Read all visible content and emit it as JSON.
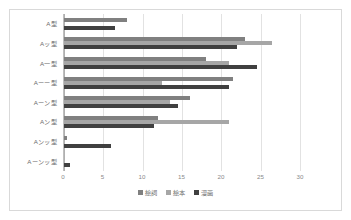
{
  "chart_data": {
    "type": "bar",
    "orientation": "horizontal",
    "title": "",
    "xlabel": "",
    "ylabel": "",
    "xlim": [
      0,
      30
    ],
    "xticks": [
      0,
      5,
      10,
      15,
      20,
      25,
      30
    ],
    "grid": true,
    "legend_position": "bottom",
    "categories": [
      "A型",
      "Aッ型",
      "A一型",
      "Aーー型",
      "Aーン型",
      "Aン型",
      "Aンッ型",
      "Aーンッ型"
    ],
    "series": [
      {
        "name": "絵詞",
        "color": "#808080",
        "values": [
          8.0,
          23.0,
          18.0,
          21.5,
          16.0,
          12.0,
          0.4,
          0.0
        ]
      },
      {
        "name": "絵本",
        "color": "#a6a6a6",
        "values": [
          0.0,
          26.5,
          21.0,
          12.5,
          13.5,
          21.0,
          0.0,
          0.0
        ]
      },
      {
        "name": "漫画",
        "color": "#404040",
        "values": [
          6.5,
          22.0,
          24.5,
          21.0,
          14.5,
          11.5,
          6.0,
          0.8
        ]
      }
    ]
  },
  "legend": {
    "items": [
      {
        "label": "絵詞",
        "color": "#808080"
      },
      {
        "label": "絵本",
        "color": "#a6a6a6"
      },
      {
        "label": "漫画",
        "color": "#404040"
      }
    ]
  },
  "axis": {
    "tick_labels": [
      "0",
      "5",
      "10",
      "15",
      "20",
      "25",
      "30"
    ]
  }
}
